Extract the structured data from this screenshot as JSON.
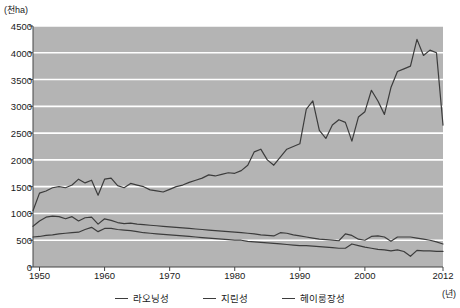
{
  "chart_data": {
    "type": "line",
    "title": "",
    "xlabel": "(년)",
    "ylabel": "(천ha)",
    "y_unit_label": "(천ha)",
    "x_unit_label": "(년)",
    "ylim": [
      0,
      4500
    ],
    "xlim": [
      1949,
      2012
    ],
    "y_ticks": [
      0,
      500,
      1000,
      1500,
      2000,
      2500,
      3000,
      3500,
      4000,
      4500
    ],
    "y_tick_labels": [
      "0",
      "500",
      "1000",
      "1500",
      "2000",
      "2500",
      "3000",
      "3500",
      "4000",
      "4500"
    ],
    "x_ticks": [
      1950,
      1960,
      1970,
      1980,
      1990,
      2000,
      2012
    ],
    "x_tick_labels": [
      "1950",
      "1960",
      "1970",
      "1980",
      "1990",
      "2000",
      "2012"
    ],
    "grid": "horizontal",
    "plot_background": "#b4b4b4",
    "gridline_color": "#ffffff",
    "line_color": "#3c3c3c",
    "legend_position": "bottom",
    "x": [
      1949,
      1950,
      1951,
      1952,
      1953,
      1954,
      1955,
      1956,
      1957,
      1958,
      1959,
      1960,
      1961,
      1962,
      1963,
      1964,
      1965,
      1966,
      1967,
      1968,
      1969,
      1970,
      1971,
      1972,
      1973,
      1974,
      1975,
      1976,
      1977,
      1978,
      1979,
      1980,
      1981,
      1982,
      1983,
      1984,
      1985,
      1986,
      1987,
      1988,
      1989,
      1990,
      1991,
      1992,
      1993,
      1994,
      1995,
      1996,
      1997,
      1998,
      1999,
      2000,
      2001,
      2002,
      2003,
      2004,
      2005,
      2006,
      2007,
      2008,
      2009,
      2010,
      2011,
      2012
    ],
    "series": [
      {
        "name": "라오닝성",
        "values": [
          1050,
          1380,
          1420,
          1480,
          1500,
          1480,
          1530,
          1640,
          1570,
          1620,
          1340,
          1640,
          1660,
          1520,
          1480,
          1560,
          1530,
          1500,
          1440,
          1420,
          1400,
          1450,
          1500,
          1530,
          1580,
          1620,
          1660,
          1720,
          1700,
          1730,
          1760,
          1750,
          1800,
          1900,
          2150,
          2200,
          2000,
          1900,
          2050,
          2200,
          2250,
          2300,
          2950,
          3100,
          2550,
          2400,
          2650,
          2750,
          2700,
          2350,
          2800,
          2900,
          3300,
          3100,
          2850,
          3350,
          3650,
          3700,
          3750,
          4250,
          3950,
          4050,
          4000,
          2650
        ]
      },
      {
        "name": "지린성",
        "values": [
          760,
          860,
          930,
          950,
          940,
          900,
          940,
          860,
          920,
          930,
          800,
          900,
          870,
          830,
          810,
          820,
          800,
          790,
          780,
          770,
          760,
          750,
          740,
          730,
          720,
          710,
          700,
          690,
          680,
          670,
          660,
          650,
          640,
          630,
          620,
          600,
          590,
          580,
          640,
          630,
          600,
          580,
          560,
          540,
          520,
          510,
          500,
          490,
          620,
          590,
          520,
          500,
          570,
          580,
          560,
          480,
          560,
          560,
          560,
          540,
          520,
          500,
          470,
          430
        ]
      },
      {
        "name": "헤이룽장성",
        "values": [
          560,
          570,
          590,
          600,
          620,
          630,
          640,
          650,
          700,
          740,
          660,
          720,
          720,
          700,
          690,
          680,
          660,
          640,
          630,
          620,
          610,
          600,
          590,
          580,
          570,
          560,
          550,
          540,
          530,
          520,
          510,
          500,
          500,
          480,
          470,
          460,
          450,
          440,
          430,
          420,
          410,
          400,
          400,
          390,
          380,
          370,
          360,
          350,
          350,
          430,
          400,
          370,
          350,
          330,
          320,
          300,
          320,
          290,
          200,
          310,
          300,
          300,
          290,
          290
        ]
      }
    ]
  },
  "legend": {
    "items": [
      {
        "label": "라오닝성"
      },
      {
        "label": "지린성"
      },
      {
        "label": "헤이룽장성"
      }
    ]
  }
}
